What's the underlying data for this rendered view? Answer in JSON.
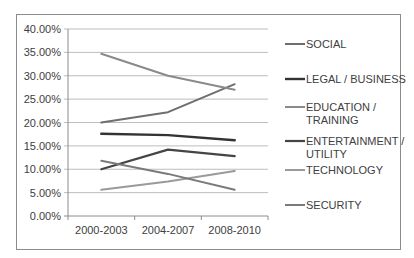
{
  "chart_data": {
    "type": "line",
    "title": "",
    "xlabel": "",
    "ylabel": "",
    "categories": [
      "2000-2003",
      "2004-2007",
      "2008-2010"
    ],
    "ylim": [
      0,
      40
    ],
    "yticks": [
      "0.00%",
      "5.00%",
      "10.00%",
      "15.00%",
      "20.00%",
      "25.00%",
      "30.00%",
      "35.00%",
      "40.00%"
    ],
    "grid": true,
    "legend_position": "right",
    "series": [
      {
        "name": "SOCIAL",
        "color": "#6e6e6e",
        "width": 2,
        "values": [
          20.0,
          22.2,
          28.2
        ]
      },
      {
        "name": "LEGAL / BUSINESS",
        "color": "#333333",
        "width": 2.4,
        "values": [
          17.6,
          17.3,
          16.2
        ]
      },
      {
        "name": "EDUCATION / TRAINING",
        "color": "#8a8a8a",
        "width": 2,
        "values": [
          34.7,
          30.0,
          27.0
        ]
      },
      {
        "name": "ENTERTAINMENT / UTILITY",
        "color": "#454545",
        "width": 2.2,
        "values": [
          10.0,
          14.2,
          12.8
        ]
      },
      {
        "name": "TECHNOLOGY",
        "color": "#9a9a9a",
        "width": 2,
        "values": [
          5.6,
          7.4,
          9.6
        ]
      },
      {
        "name": "SECURITY",
        "color": "#7a7a7a",
        "width": 2,
        "values": [
          11.8,
          9.0,
          5.6
        ]
      }
    ],
    "legend": [
      {
        "lines": [
          "SOCIAL"
        ]
      },
      {
        "lines": [
          "LEGAL / BUSINESS"
        ]
      },
      {
        "lines": [
          "EDUCATION /",
          "TRAINING"
        ]
      },
      {
        "lines": [
          "ENTERTAINMENT /",
          "UTILITY"
        ]
      },
      {
        "lines": [
          "TECHNOLOGY"
        ]
      },
      {
        "lines": [
          "SECURITY"
        ]
      }
    ]
  }
}
